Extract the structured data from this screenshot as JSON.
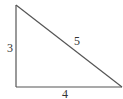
{
  "diagram": {
    "type": "right-triangle",
    "sides": {
      "vertical": "3",
      "horizontal": "4",
      "hypotenuse": "5"
    },
    "stroke_color": "#555555",
    "label_color": "#333333"
  }
}
